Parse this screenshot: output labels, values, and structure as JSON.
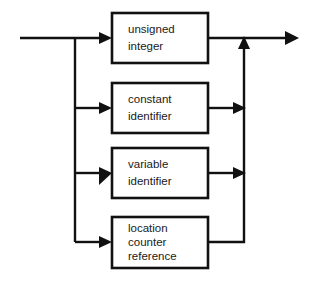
{
  "diagram": {
    "type": "railroad-syntax-diagram",
    "title": "",
    "background_color": "#ffffff",
    "line_color": "#111111",
    "text_color": "#1a1a1a",
    "entry": {
      "name": "entry-line",
      "start_x": 20,
      "y": 38
    },
    "exit": {
      "name": "exit-line",
      "end_x": 298,
      "y": 38
    },
    "branch_bus_x": 75,
    "merge_bus_x": 244,
    "boxes": [
      {
        "id": "unsigned-integer",
        "lines": [
          "unsigned",
          "integer"
        ],
        "x": 112,
        "y": 13,
        "width": 96,
        "height": 50,
        "entry_y": 38,
        "exit_y": 38,
        "exit_style": "straight-to-exit"
      },
      {
        "id": "constant-identifier",
        "lines": [
          "constant",
          "identifier"
        ],
        "x": 112,
        "y": 83,
        "width": 96,
        "height": 50,
        "entry_y": 108,
        "exit_y": 108,
        "exit_style": "arrow-into-merge"
      },
      {
        "id": "variable-identifier",
        "lines": [
          "variable",
          "identifier"
        ],
        "x": 112,
        "y": 148,
        "width": 96,
        "height": 50,
        "entry_y": 173,
        "exit_y": 173,
        "exit_style": "arrow-into-merge"
      },
      {
        "id": "location-counter-reference",
        "lines": [
          "location",
          "counter",
          "reference"
        ],
        "x": 112,
        "y": 217,
        "width": 96,
        "height": 51,
        "entry_y": 242,
        "exit_y": 242,
        "exit_style": "elbow-into-merge"
      }
    ]
  }
}
